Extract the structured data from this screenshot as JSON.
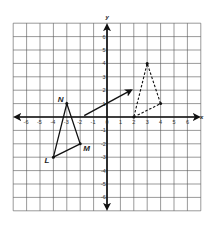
{
  "diagram": {
    "type": "coordinate-plane-translation",
    "axes": {
      "x_label": "x",
      "y_label": "y",
      "x_ticks": [
        "-6",
        "-5",
        "-4",
        "-3",
        "-2",
        "-1",
        "0",
        "1",
        "2",
        "3",
        "4",
        "5",
        "6"
      ],
      "y_ticks": [
        "6",
        "5",
        "4",
        "3",
        "2",
        "1",
        "-1",
        "-2",
        "-3",
        "-4",
        "-5",
        "-6"
      ],
      "range": [
        -7,
        7
      ]
    },
    "preimage": {
      "style": "solid",
      "vertices": [
        {
          "label": "L",
          "x": -4,
          "y": -3
        },
        {
          "label": "M",
          "x": -2,
          "y": -2
        },
        {
          "label": "N",
          "x": -3,
          "y": 1
        }
      ]
    },
    "image": {
      "style": "dashed",
      "vertices": [
        {
          "label": "",
          "x": 2,
          "y": 0
        },
        {
          "label": "",
          "x": 4,
          "y": 1
        },
        {
          "label": "",
          "x": 3,
          "y": 4
        }
      ]
    },
    "translation_arrow": {
      "from": [
        -1.7,
        0.1
      ],
      "to": [
        1.8,
        2.0
      ]
    },
    "colors": {
      "grid": "#555555",
      "lines": "#111111",
      "background": "#ffffff"
    }
  }
}
